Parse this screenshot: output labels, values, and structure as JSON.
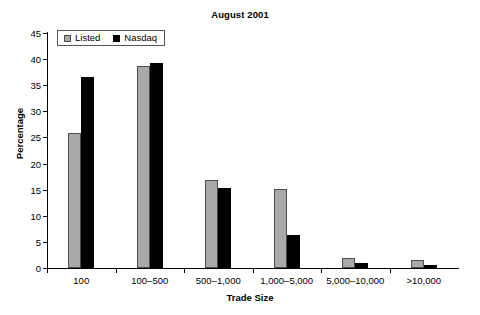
{
  "chart_data": {
    "type": "bar",
    "title": "August 2001",
    "xlabel": "Trade Size",
    "ylabel": "Percentage",
    "categories": [
      "100",
      "100–500",
      "500–1,000",
      "1,000–5,000",
      "5,000–10,000",
      ">10,000"
    ],
    "series": [
      {
        "name": "Listed",
        "color": "#a9a9a9",
        "values": [
          25.9,
          38.7,
          16.9,
          15.2,
          2.0,
          1.6
        ]
      },
      {
        "name": "Nasdaq",
        "color": "#000000",
        "values": [
          36.6,
          39.3,
          15.3,
          6.3,
          0.9,
          0.5
        ]
      }
    ],
    "ylim": [
      0,
      45
    ],
    "yticks": [
      0,
      5,
      10,
      15,
      20,
      25,
      30,
      35,
      40,
      45
    ],
    "ytick_labels": [
      "0",
      "5",
      "10",
      "15",
      "20",
      "25",
      "30",
      "35",
      "40",
      "45"
    ],
    "grid": false,
    "legend_position": "upper left"
  }
}
